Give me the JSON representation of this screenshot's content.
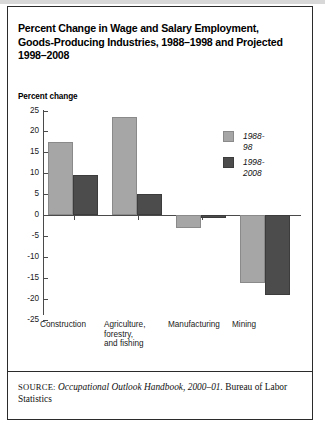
{
  "figure": {
    "title": "Percent Change in Wage and Salary Employment, Goods-Producing Industries, 1988–1998 and Projected 1998–2008",
    "axis_title": "Percent change",
    "source_prefix": "SOURCE:",
    "source_italic": "Occupational Outlook Handbook, 2000–01.",
    "source_rest": "Bureau of Labor Statistics"
  },
  "colors": {
    "series_1988_98": "#a6a6a6",
    "series_1998_2008": "#4c4c4c",
    "axis": "#4a4a4a",
    "frame": "#2b2b2b",
    "background": "#ffffff"
  },
  "chart_data": {
    "type": "bar",
    "title": "Percent Change in Wage and Salary Employment, Goods-Producing Industries, 1988–1998 and Projected 1998–2008",
    "xlabel": "",
    "ylabel": "Percent change",
    "ylim": [
      -25,
      25
    ],
    "yticks": [
      25,
      20,
      15,
      10,
      5,
      0,
      -5,
      -10,
      -15,
      -20,
      -25
    ],
    "ytick_labels": [
      "25",
      "20",
      "15",
      "10",
      "5",
      "0",
      "-5",
      "-10",
      "-15",
      "-20",
      "-25"
    ],
    "grid": false,
    "legend_position": "top-right",
    "categories": [
      "Construction",
      "Agriculture, forestry, and fishing",
      "Manufacturing",
      "Mining"
    ],
    "category_lines": [
      [
        "Construction"
      ],
      [
        "Agriculture,",
        "forestry,",
        "and fishing"
      ],
      [
        "Manufacturing"
      ],
      [
        "Mining"
      ]
    ],
    "series": [
      {
        "name": "1988-98",
        "color": "#a6a6a6",
        "values": [
          17.5,
          23.5,
          -3.0,
          -16.3
        ]
      },
      {
        "name": "1998-2008",
        "color": "#4c4c4c",
        "values": [
          9.5,
          5.0,
          -0.6,
          -19.2
        ]
      }
    ]
  }
}
